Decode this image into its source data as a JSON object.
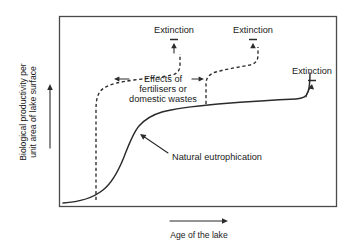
{
  "figure": {
    "axes": {
      "y_label": "Biological productivity per unit area of lake surface",
      "x_label": "Age of the lake"
    },
    "annotations": {
      "extinction_1": "Extinction",
      "extinction_2": "Extinction",
      "extinction_3": "Extinction",
      "effects_line_1": "Effects of",
      "effects_line_2": "fertilisers or",
      "effects_line_3": "domestic wastes",
      "natural": "Natural eutrophication"
    },
    "colors": {
      "ink": "#2b2b2b",
      "frame": "#4a4a4a",
      "background": "#ffffff"
    }
  },
  "chart_data": {
    "type": "line",
    "title": "",
    "xlabel": "Age of the lake",
    "ylabel": "Biological productivity per unit area of lake surface",
    "xlim": [
      0,
      100
    ],
    "ylim": [
      0,
      100
    ],
    "grid": false,
    "legend": "none",
    "axis_ticks": {
      "x": [],
      "y": []
    },
    "series": [
      {
        "name": "Natural eutrophication",
        "style": "solid",
        "x": [
          2,
          8,
          14,
          18,
          22,
          26,
          30,
          34,
          38,
          44,
          52,
          62,
          72,
          82,
          88,
          90,
          91,
          92
        ],
        "y": [
          2,
          3,
          5,
          8,
          13,
          22,
          34,
          45,
          53,
          58,
          61,
          63,
          65,
          66,
          67,
          72,
          83,
          92
        ]
      },
      {
        "name": "Fertiliser/domestic waste acceleration (early lake)",
        "style": "dashed",
        "x": [
          16,
          16,
          16,
          17,
          19,
          23,
          30,
          38,
          44,
          47,
          48,
          48
        ],
        "y": [
          4,
          20,
          45,
          62,
          70,
          73,
          74,
          75,
          77,
          83,
          89,
          93
        ]
      },
      {
        "name": "Fertiliser/domestic waste acceleration (mature lake)",
        "style": "dashed",
        "x": [
          57,
          57,
          57,
          58,
          61,
          66,
          72,
          78,
          82,
          84,
          85,
          85
        ],
        "y": [
          62,
          68,
          74,
          76,
          78,
          79,
          80,
          82,
          85,
          89,
          92,
          94
        ]
      }
    ],
    "annotations": [
      {
        "text": "Extinction",
        "x": 44,
        "y": 99,
        "arrow_to": [
          46,
          90
        ]
      },
      {
        "text": "Extinction",
        "x": 80,
        "y": 99,
        "arrow_to": [
          82,
          91
        ]
      },
      {
        "text": "Extinction",
        "x": 97,
        "y": 80,
        "arrow_to": [
          93,
          74
        ]
      },
      {
        "text": "Effects of fertilisers or domestic wastes",
        "x": 38,
        "y": 70,
        "arrow_to": [
          20,
          70
        ]
      },
      {
        "text": "Natural eutrophication",
        "x": 60,
        "y": 38,
        "arrow_to": [
          38,
          52
        ]
      }
    ]
  }
}
